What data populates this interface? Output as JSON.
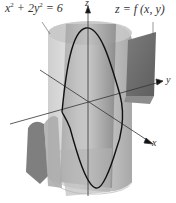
{
  "figure": {
    "type": "3d-surface-intersection",
    "labels": {
      "cylinder_equation_lhs_x": "x",
      "cylinder_equation_exp_x": "2",
      "cylinder_equation_mid": " + 2y",
      "cylinder_equation_exp_y": "2",
      "cylinder_equation_rhs": " = 6",
      "surface_equation": "z = f (x, y)",
      "axis_z": "z",
      "axis_y": "y",
      "axis_x": "x"
    },
    "colors": {
      "background": "#ffffff",
      "cylinder_light": "#d9d9d9",
      "cylinder_mid": "#bdbdbd",
      "surface_dark": "#6f6f6f",
      "surface_mid": "#9a9a9a",
      "curve": "#111111",
      "axis": "#333333"
    }
  }
}
